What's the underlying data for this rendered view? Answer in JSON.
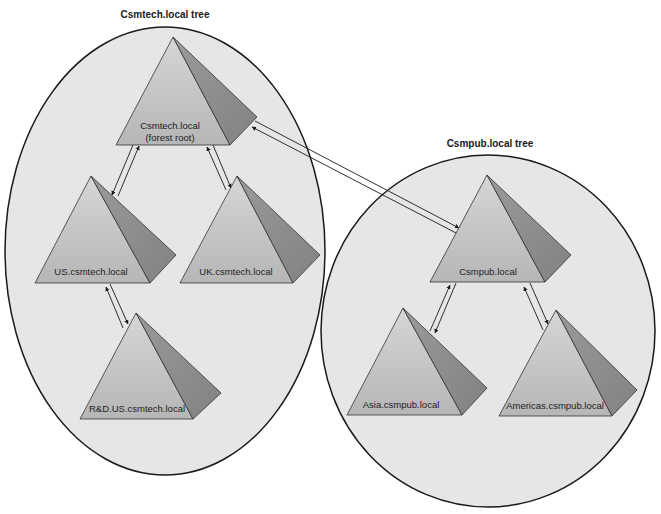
{
  "diagram": {
    "trees": [
      {
        "title": "Csmtech.local tree",
        "nodes": [
          {
            "id": "csmtech",
            "label": "Csmtech.local",
            "sublabel": "(forest root)"
          },
          {
            "id": "us",
            "label": "US.csmtech.local"
          },
          {
            "id": "uk",
            "label": "UK.csmtech.local"
          },
          {
            "id": "rd",
            "label": "R&D.US.csmtech.local"
          }
        ]
      },
      {
        "title": "Csmpub.local tree",
        "nodes": [
          {
            "id": "csmpub",
            "label": "Csmpub.local"
          },
          {
            "id": "asia",
            "label": "Asia.csmpub.local"
          },
          {
            "id": "americas",
            "label": "Americas.csmpub.local"
          }
        ]
      }
    ],
    "trusts": [
      {
        "from": "csmtech",
        "to": "us",
        "type": "two-way"
      },
      {
        "from": "csmtech",
        "to": "uk",
        "type": "two-way"
      },
      {
        "from": "us",
        "to": "rd",
        "type": "two-way"
      },
      {
        "from": "csmtech",
        "to": "csmpub",
        "type": "two-way"
      },
      {
        "from": "csmpub",
        "to": "asia",
        "type": "two-way"
      },
      {
        "from": "csmpub",
        "to": "americas",
        "type": "two-way"
      }
    ],
    "colors": {
      "ellipse_fill": "#e6e6e6",
      "outline": "#1a1a1a",
      "pyramid_front": "#c4c4c4",
      "pyramid_side": "#8e8e8e",
      "pyramid_base": "#b0b0b0"
    }
  }
}
